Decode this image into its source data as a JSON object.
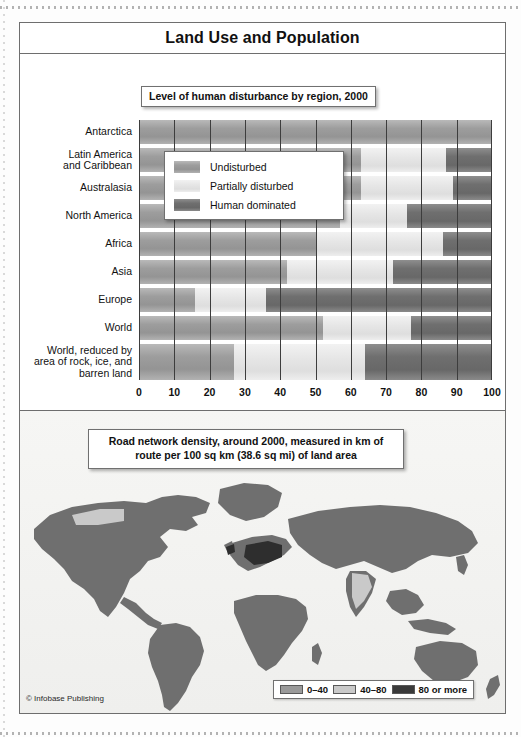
{
  "figure": {
    "title": "Land Use and Population",
    "credit": "© Infobase Publishing"
  },
  "chart_data": {
    "type": "bar",
    "subtype": "horizontal stacked bar (100%)",
    "title": "Level of human disturbance by region, 2000",
    "xlabel": "percent",
    "ylabel": "",
    "xlim": [
      0,
      100
    ],
    "xticks": [
      "0",
      "10",
      "20",
      "30",
      "40",
      "50",
      "60",
      "70",
      "80",
      "90",
      "100"
    ],
    "grid": "vertical",
    "legend_position": "inside-upper-left",
    "categories": [
      "Antarctica",
      "Latin America and Caribbean",
      "Australasia",
      "North America",
      "Africa",
      "Asia",
      "Europe",
      "World",
      "World, reduced by area of rock, ice, and barren land"
    ],
    "series": [
      {
        "name": "Undisturbed",
        "color": "#9d9d9d",
        "values": [
          100,
          63,
          63,
          57,
          50,
          42,
          16,
          52,
          27
        ]
      },
      {
        "name": "Partially disturbed",
        "color": "#e6e6e6",
        "values": [
          0,
          24,
          26,
          19,
          36,
          30,
          20,
          25,
          37
        ]
      },
      {
        "name": "Human dominated",
        "color": "#6f6f6f",
        "values": [
          0,
          13,
          11,
          24,
          14,
          28,
          64,
          23,
          36
        ]
      }
    ]
  },
  "chart": {
    "caption": "Level of human disturbance by region, 2000",
    "axis_label": "percent",
    "ticks": [
      "0",
      "10",
      "20",
      "30",
      "40",
      "50",
      "60",
      "70",
      "80",
      "90",
      "100"
    ],
    "row_labels": [
      "Antarctica",
      "Latin America\nand Caribbean",
      "Australasia",
      "North America",
      "Africa",
      "Asia",
      "Europe",
      "World",
      "World, reduced by\narea of rock, ice, and\nbarren land"
    ],
    "legend": [
      {
        "label": "Undisturbed",
        "color": "#9d9d9d"
      },
      {
        "label": "Partially disturbed",
        "color": "#e6e6e6"
      },
      {
        "label": "Human dominated",
        "color": "#6f6f6f"
      }
    ]
  },
  "map": {
    "caption": "Road network density, around 2000, measured in km of route per 100 sq km (38.6 sq mi) of land area",
    "legend": [
      {
        "label": "0–40",
        "color": "#9a9a9a"
      },
      {
        "label": "40–80",
        "color": "#c9c9c9"
      },
      {
        "label": "80 or more",
        "color": "#3a3a3a"
      }
    ]
  }
}
